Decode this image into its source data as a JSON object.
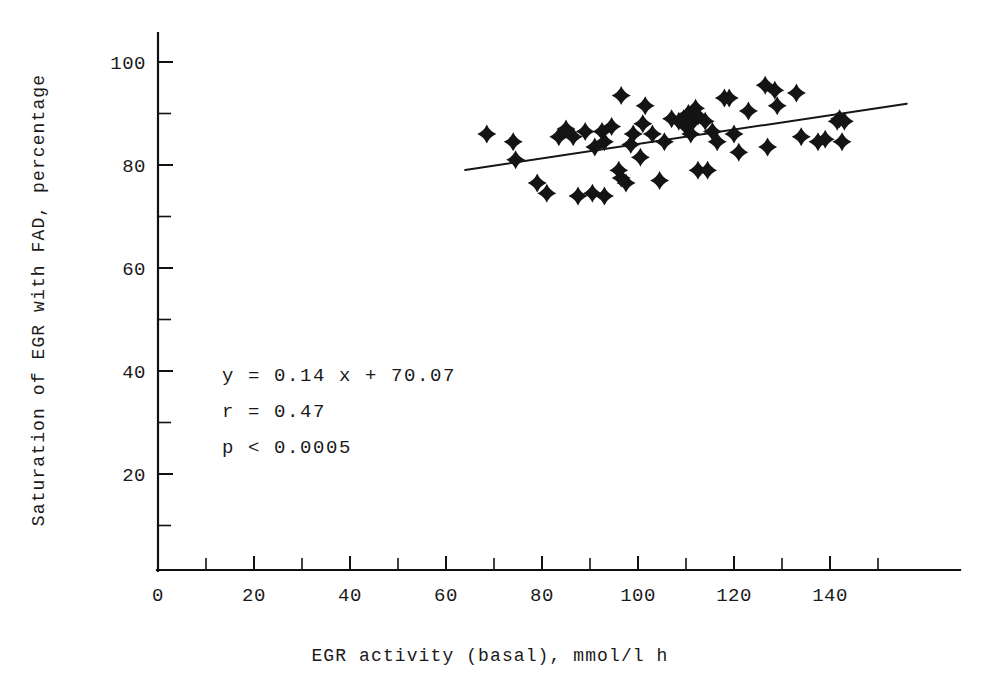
{
  "chart_data": {
    "type": "scatter",
    "title": "",
    "xlabel": "EGR activity (basal), mmol/l h",
    "ylabel": "Saturation of EGR with FAD, percentage",
    "xlim": [
      0,
      157
    ],
    "ylim": [
      0,
      106
    ],
    "grid": false,
    "legend_position": "none",
    "x_ticks_major": [
      0,
      20,
      40,
      60,
      80,
      100,
      120,
      140
    ],
    "x_tick_labels": [
      "0",
      "20",
      "40",
      "60",
      "80",
      "100",
      "120",
      "140"
    ],
    "x_ticks_minor": [
      10,
      30,
      50,
      70,
      90,
      110,
      130,
      150
    ],
    "y_ticks_major": [
      20,
      40,
      60,
      80,
      100
    ],
    "y_tick_labels": [
      "20",
      "40",
      "60",
      "80",
      "100"
    ],
    "y_ticks_minor": [
      10,
      30,
      50,
      70,
      90
    ],
    "marker_style": "four-pointed-star",
    "series": [
      {
        "name": "EGR saturation vs basal activity",
        "points": [
          [
            68.5,
            86.0
          ],
          [
            74.0,
            84.5
          ],
          [
            74.5,
            81.0
          ],
          [
            79.0,
            76.5
          ],
          [
            81.0,
            74.5
          ],
          [
            83.5,
            85.5
          ],
          [
            85.0,
            87.0
          ],
          [
            86.5,
            85.5
          ],
          [
            87.5,
            74.0
          ],
          [
            89.0,
            86.5
          ],
          [
            90.5,
            74.5
          ],
          [
            91.0,
            83.5
          ],
          [
            92.5,
            86.5
          ],
          [
            93.0,
            84.5
          ],
          [
            93.0,
            74.0
          ],
          [
            94.5,
            87.5
          ],
          [
            96.5,
            93.5
          ],
          [
            96.0,
            79.0
          ],
          [
            96.5,
            77.5
          ],
          [
            97.5,
            76.5
          ],
          [
            98.5,
            84.0
          ],
          [
            99.0,
            86.0
          ],
          [
            100.5,
            81.5
          ],
          [
            101.0,
            88.0
          ],
          [
            101.5,
            91.5
          ],
          [
            103.0,
            86.0
          ],
          [
            104.5,
            77.0
          ],
          [
            105.5,
            84.5
          ],
          [
            107.0,
            89.0
          ],
          [
            108.5,
            88.5
          ],
          [
            109.5,
            89.0
          ],
          [
            110.0,
            87.5
          ],
          [
            110.5,
            90.0
          ],
          [
            111.0,
            86.0
          ],
          [
            111.5,
            88.5
          ],
          [
            112.0,
            91.0
          ],
          [
            112.5,
            89.5
          ],
          [
            112.5,
            79.0
          ],
          [
            114.0,
            88.5
          ],
          [
            114.5,
            79.0
          ],
          [
            115.5,
            86.5
          ],
          [
            116.5,
            84.5
          ],
          [
            118.0,
            93.0
          ],
          [
            119.0,
            93.0
          ],
          [
            120.0,
            86.0
          ],
          [
            121.0,
            82.5
          ],
          [
            123.0,
            90.5
          ],
          [
            126.5,
            95.5
          ],
          [
            127.0,
            83.5
          ],
          [
            128.5,
            94.5
          ],
          [
            129.0,
            91.5
          ],
          [
            133.0,
            94.0
          ],
          [
            134.0,
            85.5
          ],
          [
            137.5,
            84.5
          ],
          [
            139.0,
            85.0
          ],
          [
            141.5,
            88.5
          ],
          [
            142.0,
            89.0
          ],
          [
            142.5,
            84.5
          ],
          [
            143.0,
            88.5
          ]
        ]
      }
    ],
    "fit_line": {
      "equation": "y = 0.14 x + 70.07",
      "slope": 0.14,
      "intercept": 70.07,
      "x_start": 64,
      "x_end": 156
    },
    "annotations": {
      "equation": "y = 0.14 x + 70.07",
      "correlation": "r = 0.47",
      "pvalue": "p < 0.0005"
    }
  }
}
